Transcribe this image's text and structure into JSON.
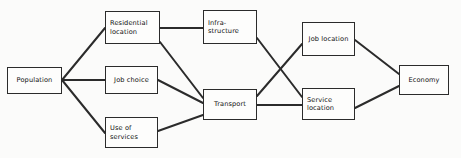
{
  "diagram": {
    "type": "node-link-flow-diagram",
    "canvas": {
      "width": 461,
      "height": 158,
      "background": "#fbfbfa"
    },
    "style": {
      "box_fill": "#fdfdfc",
      "box_border": "#2b2b2b",
      "edge_color": "#2b2b2b",
      "text_color": "#111111"
    },
    "nodes": [
      {
        "id": "population",
        "label": "Population",
        "x": 7,
        "y": 67,
        "w": 55,
        "h": 27,
        "align": "center"
      },
      {
        "id": "residential",
        "label": "Residential\nlocation",
        "x": 105,
        "y": 11,
        "w": 55,
        "h": 33,
        "align": "left"
      },
      {
        "id": "job_choice",
        "label": "Job choice",
        "x": 105,
        "y": 66,
        "w": 53,
        "h": 28,
        "align": "center"
      },
      {
        "id": "use_of_services",
        "label": "Use of\nservices",
        "x": 105,
        "y": 117,
        "w": 53,
        "h": 31,
        "align": "left"
      },
      {
        "id": "infrastructure",
        "label": "Infra-\nstructure",
        "x": 203,
        "y": 10,
        "w": 54,
        "h": 34,
        "align": "left"
      },
      {
        "id": "transport",
        "label": "Transport",
        "x": 203,
        "y": 89,
        "w": 54,
        "h": 31,
        "align": "center"
      },
      {
        "id": "job_location",
        "label": "Job location",
        "x": 302,
        "y": 22,
        "w": 53,
        "h": 34,
        "align": "center"
      },
      {
        "id": "service_location",
        "label": "Service\nlocation",
        "x": 302,
        "y": 88,
        "w": 53,
        "h": 32,
        "align": "left"
      },
      {
        "id": "economy",
        "label": "Economy",
        "x": 399,
        "y": 65,
        "w": 50,
        "h": 30,
        "align": "center"
      }
    ],
    "edges": [
      {
        "from": "population",
        "to": "residential",
        "x1": 62,
        "y1": 80,
        "x2": 105,
        "y2": 28
      },
      {
        "from": "population",
        "to": "job_choice",
        "x1": 62,
        "y1": 80,
        "x2": 105,
        "y2": 80
      },
      {
        "from": "population",
        "to": "use_of_services",
        "x1": 62,
        "y1": 80,
        "x2": 105,
        "y2": 133
      },
      {
        "from": "residential",
        "to": "infrastructure",
        "x1": 160,
        "y1": 28,
        "x2": 203,
        "y2": 28
      },
      {
        "from": "residential",
        "to": "transport",
        "x1": 160,
        "y1": 42,
        "x2": 203,
        "y2": 98
      },
      {
        "from": "job_choice",
        "to": "transport",
        "x1": 158,
        "y1": 80,
        "x2": 203,
        "y2": 103
      },
      {
        "from": "use_of_services",
        "to": "transport",
        "x1": 158,
        "y1": 131,
        "x2": 203,
        "y2": 115
      },
      {
        "from": "infrastructure",
        "to": "service_location",
        "x1": 257,
        "y1": 38,
        "x2": 302,
        "y2": 97
      },
      {
        "from": "transport",
        "to": "job_location",
        "x1": 257,
        "y1": 96,
        "x2": 302,
        "y2": 44
      },
      {
        "from": "transport",
        "to": "service_location",
        "x1": 257,
        "y1": 105,
        "x2": 302,
        "y2": 105
      },
      {
        "from": "job_location",
        "to": "economy",
        "x1": 355,
        "y1": 40,
        "x2": 399,
        "y2": 74
      },
      {
        "from": "service_location",
        "to": "economy",
        "x1": 355,
        "y1": 108,
        "x2": 399,
        "y2": 86
      }
    ]
  }
}
